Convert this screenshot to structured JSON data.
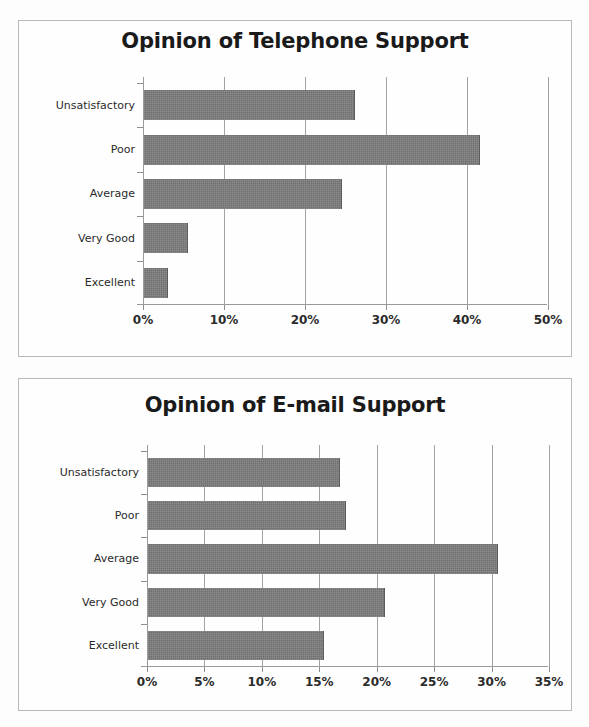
{
  "page": {
    "background_color": "#fdfdfd",
    "frame_border_color": "#b9b9b9",
    "bar_color": "#6f6f6f",
    "axis_color": "#9a9a9a",
    "gridline_color": "#a3a3a3",
    "text_color": "#2b2b2b"
  },
  "chart_data": [
    {
      "id": "telephone",
      "type": "bar",
      "orientation": "horizontal",
      "title": "Opinion of Telephone Support",
      "xlabel": "",
      "ylabel": "",
      "categories": [
        "Excellent",
        "Very Good",
        "Average",
        "Poor",
        "Unsatisfactory"
      ],
      "values": [
        3.0,
        5.4,
        24.5,
        41.5,
        26.0
      ],
      "xlim": [
        0,
        50
      ],
      "xticks": [
        0,
        10,
        20,
        30,
        40,
        50
      ],
      "xticklabels": [
        "0%",
        "10%",
        "20%",
        "30%",
        "40%",
        "50%"
      ],
      "grid": true,
      "grid_axis": "x",
      "legend": false
    },
    {
      "id": "email",
      "type": "bar",
      "orientation": "horizontal",
      "title": "Opinion of E-mail Support",
      "xlabel": "",
      "ylabel": "",
      "categories": [
        "Excellent",
        "Very Good",
        "Average",
        "Poor",
        "Unsatisfactory"
      ],
      "values": [
        15.3,
        20.6,
        30.5,
        17.2,
        16.7
      ],
      "xlim": [
        0,
        35
      ],
      "xticks": [
        0,
        5,
        10,
        15,
        20,
        25,
        30,
        35
      ],
      "xticklabels": [
        "0%",
        "5%",
        "10%",
        "15%",
        "20%",
        "25%",
        "30%",
        "35%"
      ],
      "grid": true,
      "grid_axis": "x",
      "legend": false
    }
  ]
}
